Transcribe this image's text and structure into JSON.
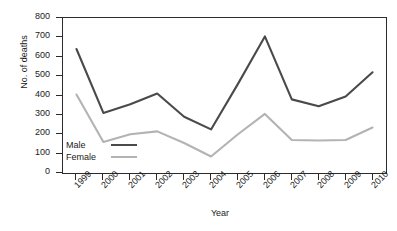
{
  "chart_data": {
    "type": "line",
    "title": "",
    "xlabel": "Year",
    "ylabel": "No. of deaths",
    "categories": [
      "1999",
      "2000",
      "2001",
      "2002",
      "2003",
      "2004",
      "2005",
      "2006",
      "2007",
      "2008",
      "2009",
      "2010"
    ],
    "ylim": [
      0,
      800
    ],
    "ytick_values": [
      0,
      100,
      200,
      300,
      400,
      500,
      600,
      700,
      800
    ],
    "ytick_labels": [
      "0",
      "100",
      "200",
      "300",
      "400",
      "500",
      "600",
      "700",
      "800"
    ],
    "grid": false,
    "legend_position": "inside-bottom-left",
    "series": [
      {
        "name": "Male",
        "color": "#4a4a4a",
        "values": [
          640,
          310,
          355,
          410,
          290,
          225,
          460,
          705,
          380,
          345,
          395,
          520
        ]
      },
      {
        "name": "Female",
        "color": "#b3b3b3",
        "values": [
          405,
          160,
          200,
          215,
          155,
          85,
          200,
          305,
          170,
          168,
          170,
          235
        ]
      }
    ]
  },
  "legend": {
    "items": [
      {
        "label": "Male"
      },
      {
        "label": "Female"
      }
    ]
  },
  "axes": {
    "x_title": "Year",
    "y_title": "No. of deaths"
  },
  "colors": {
    "male_line": "#4a4a4a",
    "female_line": "#b3b3b3",
    "axis": "#2b2b2b",
    "background": "#ffffff"
  }
}
